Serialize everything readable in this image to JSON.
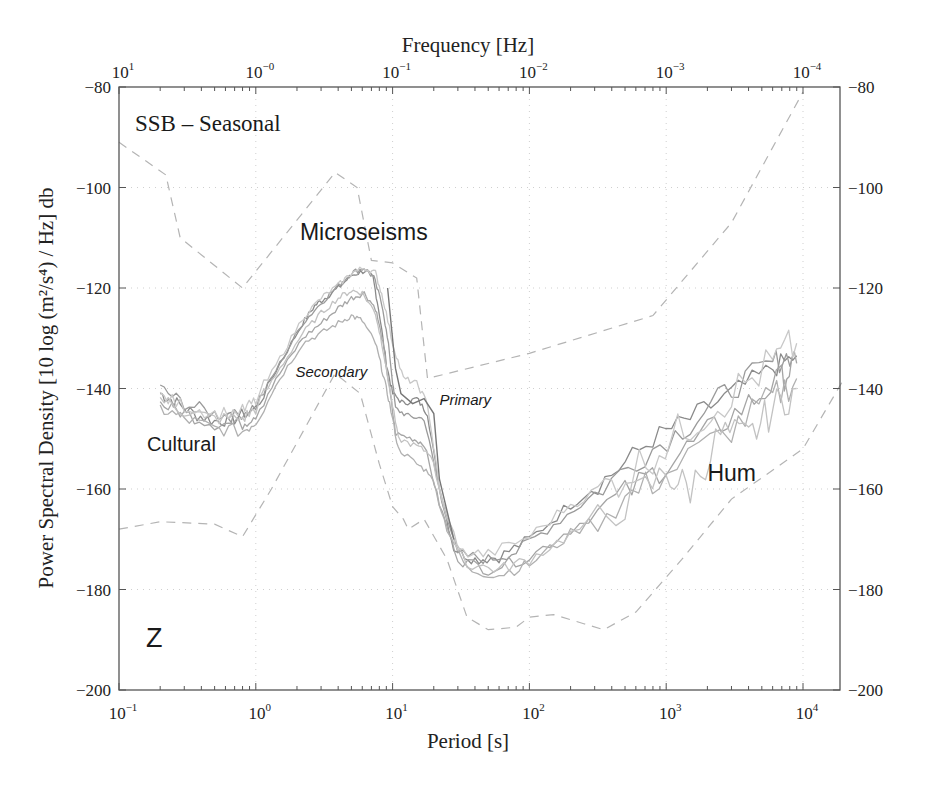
{
  "chart_data": {
    "type": "line",
    "title": "SSB – Seasonal",
    "component_label": "Z",
    "xlabel": "Period [s]",
    "x2label": "Frequency [Hz]",
    "ylabel": "Power Spectral Density [10 log (m²/s⁴) / Hz] db",
    "xscale": "log",
    "xlim": [
      0.1,
      20000
    ],
    "ylim": [
      -200,
      -80
    ],
    "grid": true,
    "x_ticks": [
      {
        "exp": "−1",
        "value": 0.1
      },
      {
        "exp": "0",
        "value": 1
      },
      {
        "exp": "1",
        "value": 10
      },
      {
        "exp": "2",
        "value": 100
      },
      {
        "exp": "3",
        "value": 1000
      },
      {
        "exp": "4",
        "value": 10000
      }
    ],
    "x2_ticks": [
      {
        "exp": "1",
        "period": 0.1
      },
      {
        "exp": "−0",
        "period": 1
      },
      {
        "exp": "−1",
        "period": 10
      },
      {
        "exp": "−2",
        "period": 100
      },
      {
        "exp": "−3",
        "period": 1000
      },
      {
        "exp": "−4",
        "period": 10000
      }
    ],
    "y_ticks": [
      -80,
      -100,
      -120,
      -140,
      -160,
      -180,
      -200
    ],
    "y_tick_labels": [
      "−80",
      "−100",
      "−120",
      "−140",
      "−160",
      "−180",
      "−200"
    ],
    "annotations": [
      {
        "text": "Microseisms",
        "period": 2.1,
        "db": -110.5,
        "size": 23,
        "italic": false
      },
      {
        "text": "Secondary",
        "period": 1.95,
        "db": -137.8,
        "size": 15,
        "italic": true
      },
      {
        "text": "Primary",
        "period": 22,
        "db": -143.3,
        "size": 15,
        "italic": true
      },
      {
        "text": "Cultural",
        "period": 0.16,
        "db": -152.5,
        "size": 20,
        "italic": false
      },
      {
        "text": "Hum",
        "period": 2000,
        "db": -158.5,
        "size": 23,
        "italic": false
      }
    ],
    "reference_curves": [
      {
        "name": "High noise model",
        "style": "dashed",
        "points": [
          [
            0.1,
            -91
          ],
          [
            0.22,
            -97.5
          ],
          [
            0.28,
            -110
          ],
          [
            0.8,
            -120
          ],
          [
            3.8,
            -97
          ],
          [
            5.5,
            -100
          ],
          [
            7,
            -114.5
          ],
          [
            10,
            -115
          ],
          [
            15,
            -118
          ],
          [
            18,
            -138
          ],
          [
            100,
            -133
          ],
          [
            800,
            -125.5
          ],
          [
            3000,
            -107
          ],
          [
            10000,
            -81
          ]
        ]
      },
      {
        "name": "Low noise model",
        "style": "dashed",
        "points": [
          [
            0.1,
            -168
          ],
          [
            0.2,
            -166.5
          ],
          [
            0.5,
            -167
          ],
          [
            0.8,
            -169.5
          ],
          [
            1.3,
            -160
          ],
          [
            3.8,
            -137
          ],
          [
            5.8,
            -141
          ],
          [
            8,
            -155
          ],
          [
            10,
            -163.5
          ],
          [
            12,
            -166
          ],
          [
            13,
            -168
          ],
          [
            17,
            -166
          ],
          [
            25,
            -174
          ],
          [
            35,
            -185.5
          ],
          [
            50,
            -188
          ],
          [
            80,
            -187.5
          ],
          [
            100,
            -185.5
          ],
          [
            150,
            -185
          ],
          [
            250,
            -186.8
          ],
          [
            350,
            -188
          ],
          [
            600,
            -184.5
          ],
          [
            1300,
            -174
          ],
          [
            3000,
            -162
          ],
          [
            10000,
            -152
          ],
          [
            20000,
            -138
          ]
        ]
      }
    ],
    "series": [
      {
        "name": "Season 1",
        "color": "#8a8a8a",
        "points": [
          [
            0.2,
            -141
          ],
          [
            0.25,
            -142.5
          ],
          [
            0.35,
            -145
          ],
          [
            0.5,
            -146.5
          ],
          [
            0.7,
            -146
          ],
          [
            1.0,
            -144
          ],
          [
            1.5,
            -135
          ],
          [
            2.2,
            -127
          ],
          [
            2.7,
            -123.5
          ],
          [
            3.2,
            -122
          ],
          [
            4,
            -120
          ],
          [
            5,
            -117.5
          ],
          [
            6.3,
            -116.5
          ],
          [
            7.2,
            -118
          ],
          [
            8,
            -125
          ],
          [
            9,
            -135
          ],
          [
            10,
            -141
          ],
          [
            12,
            -143
          ],
          [
            15,
            -142
          ],
          [
            18,
            -145
          ],
          [
            22,
            -160
          ],
          [
            28,
            -172
          ],
          [
            40,
            -174
          ],
          [
            60,
            -173.5
          ],
          [
            100,
            -170
          ],
          [
            200,
            -163
          ],
          [
            400,
            -157
          ],
          [
            800,
            -150
          ],
          [
            1500,
            -146
          ],
          [
            3000,
            -141
          ],
          [
            6000,
            -136
          ],
          [
            9000,
            -133.5
          ]
        ]
      },
      {
        "name": "Season 2",
        "color": "#9a9a9a",
        "points": [
          [
            0.2,
            -140
          ],
          [
            0.3,
            -143
          ],
          [
            0.5,
            -145
          ],
          [
            0.7,
            -145.5
          ],
          [
            1.0,
            -143.5
          ],
          [
            1.5,
            -135
          ],
          [
            2.2,
            -127
          ],
          [
            3,
            -123
          ],
          [
            4,
            -119.5
          ],
          [
            5,
            -117
          ],
          [
            6.2,
            -116
          ],
          [
            7.3,
            -118
          ],
          [
            8.5,
            -124
          ],
          [
            9.5,
            -133
          ],
          [
            10.5,
            -144
          ],
          [
            13,
            -145.5
          ],
          [
            17,
            -146
          ],
          [
            22,
            -160
          ],
          [
            30,
            -173
          ],
          [
            50,
            -174
          ],
          [
            80,
            -172.5
          ],
          [
            150,
            -167
          ],
          [
            300,
            -161
          ],
          [
            700,
            -153
          ],
          [
            1500,
            -147
          ],
          [
            3000,
            -140
          ],
          [
            6000,
            -135
          ],
          [
            8500,
            -133
          ]
        ]
      },
      {
        "name": "Season 3",
        "color": "#a5a5a5",
        "points": [
          [
            0.2,
            -143
          ],
          [
            0.3,
            -145
          ],
          [
            0.5,
            -147
          ],
          [
            0.8,
            -147
          ],
          [
            1.0,
            -145
          ],
          [
            1.5,
            -137
          ],
          [
            2.2,
            -130
          ],
          [
            3,
            -127
          ],
          [
            4,
            -124
          ],
          [
            5,
            -122
          ],
          [
            6.2,
            -121
          ],
          [
            7.5,
            -124
          ],
          [
            8.5,
            -131
          ],
          [
            9.5,
            -140
          ],
          [
            10.5,
            -149
          ],
          [
            14,
            -150
          ],
          [
            17,
            -151
          ],
          [
            22,
            -163
          ],
          [
            30,
            -174
          ],
          [
            50,
            -176
          ],
          [
            100,
            -173.5
          ],
          [
            200,
            -168
          ],
          [
            500,
            -161
          ],
          [
            1000,
            -155
          ],
          [
            2000,
            -149
          ],
          [
            4000,
            -143
          ],
          [
            7000,
            -138
          ],
          [
            9000,
            -135
          ]
        ]
      },
      {
        "name": "Season 4",
        "color": "#b0b0b0",
        "points": [
          [
            0.2,
            -144
          ],
          [
            0.3,
            -146
          ],
          [
            0.5,
            -148
          ],
          [
            0.8,
            -148.5
          ],
          [
            1.0,
            -146.5
          ],
          [
            1.5,
            -138
          ],
          [
            2.2,
            -131
          ],
          [
            3,
            -129
          ],
          [
            4,
            -127
          ],
          [
            5,
            -125.5
          ],
          [
            6,
            -126.5
          ],
          [
            7.5,
            -131
          ],
          [
            8.5,
            -137
          ],
          [
            9.5,
            -143
          ],
          [
            11,
            -152
          ],
          [
            15,
            -155
          ],
          [
            19,
            -157
          ],
          [
            25,
            -168
          ],
          [
            35,
            -176
          ],
          [
            60,
            -177
          ],
          [
            100,
            -175
          ],
          [
            200,
            -169
          ],
          [
            500,
            -162
          ],
          [
            1000,
            -157
          ],
          [
            3000,
            -148
          ],
          [
            6000,
            -142
          ],
          [
            9000,
            -138
          ]
        ]
      },
      {
        "name": "Season 5",
        "color": "#c2c2c2",
        "points": [
          [
            0.2,
            -142
          ],
          [
            0.3,
            -144.5
          ],
          [
            0.5,
            -146
          ],
          [
            0.8,
            -146
          ],
          [
            1.0,
            -144
          ],
          [
            1.5,
            -136
          ],
          [
            2.2,
            -129
          ],
          [
            3,
            -125
          ],
          [
            4,
            -122
          ],
          [
            5,
            -120.5
          ],
          [
            6,
            -121
          ],
          [
            7.5,
            -125
          ],
          [
            8.5,
            -132
          ],
          [
            9.5,
            -140
          ],
          [
            11,
            -150
          ],
          [
            15,
            -151.5
          ],
          [
            19,
            -153
          ],
          [
            25,
            -166
          ],
          [
            35,
            -175
          ],
          [
            60,
            -176
          ],
          [
            100,
            -174
          ],
          [
            200,
            -169
          ],
          [
            500,
            -163
          ],
          [
            1000,
            -157
          ],
          [
            1500,
            -160
          ],
          [
            2500,
            -149
          ],
          [
            4000,
            -150
          ],
          [
            6000,
            -144
          ],
          [
            9000,
            -140
          ]
        ]
      },
      {
        "name": "Season 6",
        "color": "#c8c8c8",
        "points": [
          [
            0.2,
            -141.5
          ],
          [
            0.3,
            -143.5
          ],
          [
            0.5,
            -145
          ],
          [
            0.8,
            -144.5
          ],
          [
            1.0,
            -142.5
          ],
          [
            1.5,
            -134
          ],
          [
            2.2,
            -126
          ],
          [
            3,
            -122
          ],
          [
            4,
            -119.5
          ],
          [
            5,
            -117
          ],
          [
            6.2,
            -116
          ],
          [
            7.5,
            -117
          ],
          [
            8.5,
            -122
          ],
          [
            10,
            -131
          ],
          [
            12,
            -138
          ],
          [
            15,
            -139
          ],
          [
            18,
            -143
          ],
          [
            22,
            -160
          ],
          [
            30,
            -172.5
          ],
          [
            50,
            -173
          ],
          [
            100,
            -169.5
          ],
          [
            200,
            -163
          ],
          [
            400,
            -159
          ],
          [
            800,
            -153
          ],
          [
            1500,
            -147
          ],
          [
            3000,
            -141
          ],
          [
            6000,
            -135
          ],
          [
            9000,
            -131
          ]
        ]
      }
    ],
    "primary_peak_line": {
      "color": "#777777",
      "points": [
        [
          9.2,
          -120
        ],
        [
          10.5,
          -136
        ],
        [
          11.5,
          -141
        ],
        [
          14,
          -143
        ],
        [
          17,
          -142
        ],
        [
          20,
          -145
        ],
        [
          22,
          -158
        ],
        [
          28,
          -170
        ]
      ]
    }
  }
}
